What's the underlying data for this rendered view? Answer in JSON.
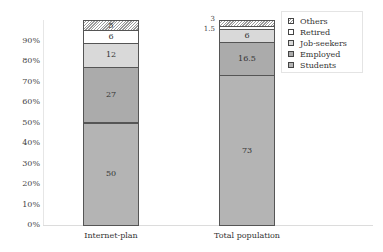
{
  "chart_data": {
    "type": "bar",
    "stacked": true,
    "percent": true,
    "title": "",
    "xlabel": "",
    "ylabel": "",
    "ylim": [
      0,
      100
    ],
    "yticks": [
      "0%",
      "10%",
      "20%",
      "30%",
      "40%",
      "50%",
      "60%",
      "70%",
      "80%",
      "90%"
    ],
    "categories": [
      "Internet-plan",
      "Total population"
    ],
    "series": [
      {
        "name": "Students",
        "values": [
          50,
          73
        ],
        "color": "#b4b4b4"
      },
      {
        "name": "Employed",
        "values": [
          27,
          16.5
        ],
        "color": "#ababab"
      },
      {
        "name": "Job-seekers",
        "values": [
          12,
          6
        ],
        "color": "#d9d9d9"
      },
      {
        "name": "Retired",
        "values": [
          6,
          1.5
        ],
        "color": "#ffffff"
      },
      {
        "name": "Others",
        "values": [
          5,
          3
        ],
        "color": "hatched"
      }
    ],
    "legend": {
      "position": "right",
      "entries": [
        "Others",
        "Retired",
        "Job-seekers",
        "Employed",
        "Students"
      ]
    },
    "grid": false
  }
}
